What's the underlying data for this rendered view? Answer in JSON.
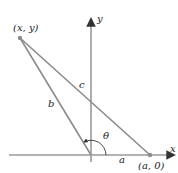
{
  "diagram": {
    "points": {
      "P": {
        "label": "(x, y)",
        "x": 20,
        "y": 38
      },
      "A": {
        "label": "(a, 0)",
        "x": 150,
        "y": 155
      },
      "O": {
        "x": 91,
        "y": 155
      }
    },
    "axes": {
      "x_label": "x",
      "y_label": "y"
    },
    "sides": {
      "a": "a",
      "b": "b",
      "c": "c"
    },
    "angle": "θ",
    "colors": {
      "line": "#8c8c8c",
      "axis": "#9a9a9a",
      "text": "#222222",
      "point": "#8c8c8c"
    }
  }
}
